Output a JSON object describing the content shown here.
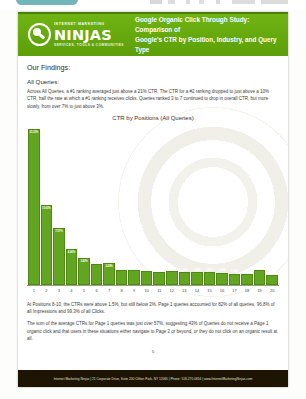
{
  "chrome": {
    "pill_label": "",
    "ghost_text": ""
  },
  "document": {
    "header": {
      "logo": {
        "pre_text": "INTERNET MARKETING",
        "main_text": "NINJAS",
        "sub_text": "SERVICES, TOOLS & COMMUNITIES"
      },
      "title_line1": "Google Organic Click Through Study: Comparison of",
      "title_line2": "Google's CTR by Position, Industry, and Query Type",
      "band_color": "#63a70a"
    },
    "findings_heading": "Our Findings:",
    "section_heading": "All Queries:",
    "intro_paragraph": "Across All Queries, a #1 ranking averaged just above a 21% CTR. The CTR for a #2 ranking dropped to just above a 10% CTR, half the rate at which a #1 ranking receives clicks. Queries ranked 3 to 7 continued to drop in overall CTR, but more slowly, from over 7% to just above 3%.",
    "after_paragraph_1": "At Positions 8-10, the CTRs were above 1.5%, but still below 2%. Page 1 queries accounted for 82% of all queries, 96.8% of all Impressions and 99.3% of all Clicks.",
    "after_paragraph_2": "The sum of the average CTRs for Page 1 queries was just over 57%, suggesting 43% of Queries do not receive a Page 1 organic click and that users in these situations either navigate to Page 2 or beyond, or they do not click on an organic result at all.",
    "page_number": "5",
    "footer_text": "Internet Marketing Ninjas | 21 Corporate Drive, Suite 200 Clifton Park, NY 12065 | Phone: 518-270-0654 | www.InternetMarketingNinjas.com"
  },
  "chart_data": {
    "type": "bar",
    "title": "CTR by Positions (All Queries)",
    "xlabel": "",
    "ylabel": "",
    "ylim": [
      0,
      22
    ],
    "grid": false,
    "legend": "none",
    "bar_color": "#62a520",
    "categories": [
      "1",
      "2",
      "3",
      "4",
      "5",
      "6",
      "7",
      "8",
      "9",
      "10",
      "11",
      "12",
      "13",
      "14",
      "15",
      "16",
      "17",
      "18",
      "19",
      "20"
    ],
    "values": [
      21.12,
      10.65,
      7.57,
      4.66,
      3.42,
      2.56,
      2.69,
      1.74,
      1.74,
      1.64,
      1.55,
      1.6,
      1.46,
      1.44,
      1.45,
      1.4,
      1.26,
      1.2,
      1.7,
      1.05
    ],
    "data_labels": [
      "21.12%",
      "10.65%",
      "7.57%",
      "4.66%",
      "3.42%",
      "2.56%",
      "2.69%",
      "1.74%",
      "1.74%",
      "1.64%",
      "1.55%",
      "1.60%",
      "1.46%",
      "1.44%",
      "1.45%",
      "1.40%",
      "1.26%",
      "1.20%",
      "1.70%",
      "1.05%"
    ]
  }
}
